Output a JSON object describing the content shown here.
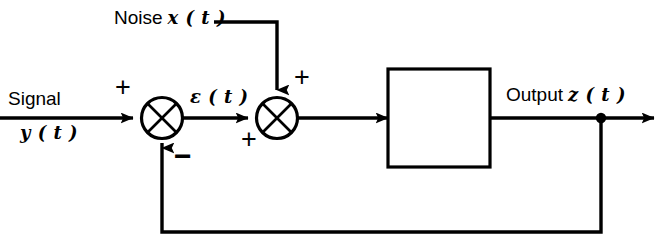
{
  "diagram": {
    "type": "block-diagram",
    "canvas": {
      "width": 668,
      "height": 252,
      "background": "#ffffff",
      "stroke": "#000000"
    },
    "labels": {
      "noise_word": "Noise",
      "noise_var": "x ( t )",
      "signal_word": "Signal",
      "signal_var": "y ( t )",
      "error_var": "ε ( t )",
      "output_word": "Output",
      "output_var": "z ( t )"
    },
    "signs": {
      "signal_plus": "+",
      "feedback_minus": "−",
      "error_plus": "+",
      "noise_plus": "+"
    },
    "nodes": [
      {
        "name": "summing-junction-1",
        "shape": "circle-with-x",
        "cx": 162,
        "cy": 118,
        "r": 21
      },
      {
        "name": "summing-junction-2",
        "shape": "circle-with-x",
        "cx": 277,
        "cy": 118,
        "r": 21
      },
      {
        "name": "system-block",
        "shape": "rectangle",
        "x": 388,
        "y": 69,
        "width": 102,
        "height": 98,
        "label": ""
      },
      {
        "name": "output-tap-point",
        "shape": "dot",
        "cx": 601,
        "cy": 118,
        "r": 5
      }
    ],
    "connections": [
      {
        "name": "signal-input-line",
        "from": "left-edge",
        "to": "summing-junction-1",
        "arrow": true
      },
      {
        "name": "error-line",
        "from": "summing-junction-1",
        "to": "summing-junction-2",
        "arrow": true
      },
      {
        "name": "noise-input-line",
        "from": "noise-label",
        "to": "summing-junction-2",
        "arrow": true
      },
      {
        "name": "junction-to-block-line",
        "from": "summing-junction-2",
        "to": "system-block",
        "arrow": true
      },
      {
        "name": "block-to-output-line",
        "from": "system-block",
        "to": "output-tap-point",
        "arrow": false
      },
      {
        "name": "output-line",
        "from": "output-tap-point",
        "to": "right-edge",
        "arrow": true
      },
      {
        "name": "feedback-line",
        "from": "output-tap-point",
        "to": "summing-junction-1",
        "arrow": true
      }
    ]
  }
}
